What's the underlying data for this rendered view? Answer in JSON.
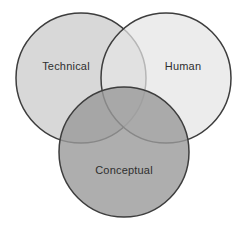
{
  "figure": {
    "type": "venn-diagram",
    "title": "",
    "background_color": "#ffffff",
    "width": 248,
    "height": 236,
    "stroke_color": "#3d3d3d",
    "stroke_width": 1.5,
    "label_color": "#2f2f2f"
  },
  "chart_data": {
    "type": "venn",
    "title": "",
    "subtitle": "",
    "xlabel": "",
    "ylabel": "",
    "grid": false,
    "legend": "none",
    "set_count": 3,
    "sets": [
      {
        "id": "technical",
        "label": "Technical",
        "fill_color": "#c9c9c9",
        "opacity": 0.72,
        "cx": 81,
        "cy": 78,
        "r": 65,
        "label_x": 66,
        "label_y": 67
      },
      {
        "id": "human",
        "label": "Human",
        "fill_color": "#e4e4e4",
        "opacity": 0.72,
        "cx": 166,
        "cy": 78,
        "r": 65,
        "label_x": 183,
        "label_y": 67
      },
      {
        "id": "conceptual",
        "label": "Conceptual",
        "fill_color": "#9a9a9a",
        "opacity": 0.8,
        "cx": 124,
        "cy": 152,
        "r": 65,
        "label_x": 124,
        "label_y": 171
      }
    ],
    "regions": [
      {
        "id": "technical-only",
        "sets": [
          "Technical"
        ],
        "shade": "light-gray"
      },
      {
        "id": "human-only",
        "sets": [
          "Human"
        ],
        "shade": "lightest-gray"
      },
      {
        "id": "conceptual-only",
        "sets": [
          "Conceptual"
        ],
        "shade": "dark-gray"
      },
      {
        "id": "technical-human",
        "sets": [
          "Technical",
          "Human"
        ],
        "shade": "light-mid-gray"
      },
      {
        "id": "technical-conceptual",
        "sets": [
          "Technical",
          "Conceptual"
        ],
        "shade": "darker-gray"
      },
      {
        "id": "human-conceptual",
        "sets": [
          "Human",
          "Conceptual"
        ],
        "shade": "mid-dark-gray"
      },
      {
        "id": "all-three",
        "sets": [
          "Technical",
          "Human",
          "Conceptual"
        ],
        "shade": "mid-gray"
      }
    ]
  }
}
